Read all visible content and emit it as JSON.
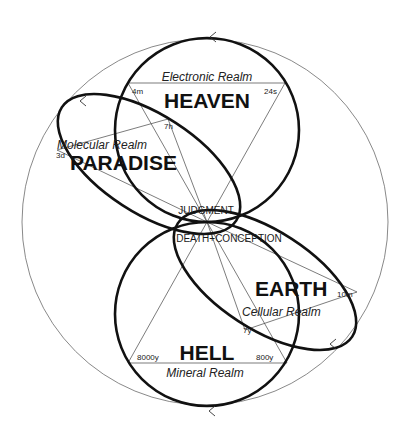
{
  "diagram": {
    "center_labels": {
      "judgment": "JUDGMENT",
      "death_conception": "DEATH+CONCEPTION"
    },
    "worlds": [
      {
        "name": "HEAVEN",
        "realm": "Electronic Realm",
        "times": [
          "4m",
          "24s"
        ],
        "shape": "circle",
        "position": "top"
      },
      {
        "name": "PARADISE",
        "realm": "Molecular Realm",
        "times": [
          "3d",
          "7h"
        ],
        "shape": "ellipse",
        "position": "upper-left"
      },
      {
        "name": "EARTH",
        "realm": "Cellular Realm",
        "times": [
          "10m",
          "7y"
        ],
        "shape": "ellipse",
        "position": "lower-right"
      },
      {
        "name": "HELL",
        "realm": "Mineral Realm",
        "times": [
          "8000y",
          "800y"
        ],
        "shape": "circle",
        "position": "bottom"
      }
    ],
    "flow_direction": "counter-clockwise arrows on outer circle and loops",
    "colors": {
      "background": "#ffffff",
      "thick_line": "#111111",
      "thin_line": "#6b6b6b"
    }
  }
}
